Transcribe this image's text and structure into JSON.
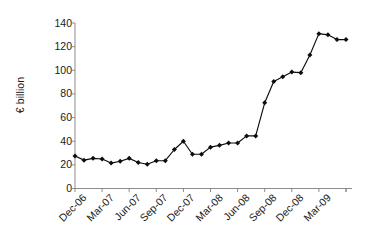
{
  "chart_data": {
    "type": "line",
    "title": "",
    "xlabel": "",
    "ylabel": "€ billion",
    "ylim": [
      0,
      140
    ],
    "ytick_values": [
      0,
      20,
      40,
      60,
      80,
      100,
      120,
      140
    ],
    "ytick_labels": [
      "0",
      "20",
      "40",
      "60",
      "80",
      "100",
      "120",
      "140"
    ],
    "grid": false,
    "legend": "none",
    "axis_color": "#808080",
    "series_color": "#0d0d0d",
    "marker": "filled-diamond",
    "x_tick_labels": [
      "Dec-06",
      "Mar-07",
      "Jun-07",
      "Sep-07",
      "Dec-07",
      "Mar-08",
      "Jun-08",
      "Sep-08",
      "Dec-08",
      "Mar-09"
    ],
    "x_tick_interval_months": 3,
    "x": [
      "Dec-06",
      "Jan-07",
      "Feb-07",
      "Mar-07",
      "Apr-07",
      "May-07",
      "Jun-07",
      "Jul-07",
      "Aug-07",
      "Sep-07",
      "Oct-07",
      "Nov-07",
      "Dec-07",
      "Jan-08",
      "Feb-08",
      "Mar-08",
      "Apr-08",
      "May-08",
      "Jun-08",
      "Jul-08",
      "Aug-08",
      "Sep-08",
      "Oct-08",
      "Nov-08",
      "Dec-08",
      "Jan-09",
      "Feb-09",
      "Mar-09",
      "Apr-09",
      "May-09",
      "Jun-09"
    ],
    "values": [
      27.5,
      24.0,
      25.5,
      25.0,
      21.5,
      23.0,
      25.5,
      22.0,
      20.5,
      23.5,
      23.5,
      33.0,
      40.0,
      29.0,
      29.0,
      35.0,
      36.5,
      38.5,
      38.5,
      44.5,
      44.5,
      72.5,
      90.5,
      94.5,
      98.5,
      98.0,
      113.0,
      131.0,
      130.0,
      126.0,
      126.0
    ],
    "point_count": 31
  }
}
